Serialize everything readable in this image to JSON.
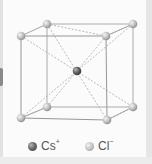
{
  "figure": {
    "structure": "cubic lattice with Cl- ions at the eight corners and a Cs+ ion at the body center"
  },
  "legend": {
    "items": [
      {
        "symbol": "Cs",
        "charge": "+",
        "color": "#555555",
        "icon": "dark-gray-sphere"
      },
      {
        "symbol": "Cl",
        "charge": "−",
        "color": "#c4c4c4",
        "icon": "light-gray-sphere"
      }
    ]
  },
  "colors": {
    "edge_line": "#9a9a9a",
    "dashed_line": "#a8a8a8",
    "panel_bg": "#fbfbfb",
    "frame_bg": "#ebebeb"
  }
}
